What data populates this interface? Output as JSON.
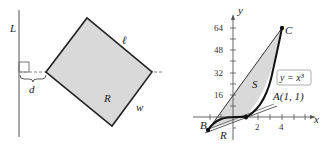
{
  "figure_left": {
    "labels": {
      "line": "L",
      "length": "ℓ",
      "width": "w",
      "region": "R",
      "distance": "d"
    },
    "colors": {
      "fill": "#d9d9d9",
      "stroke": "#222222",
      "dash": "#888888"
    }
  },
  "figure_right": {
    "axes": {
      "x_label": "x",
      "y_label": "y"
    },
    "y_ticks": [
      "16",
      "32",
      "48",
      "64"
    ],
    "x_ticks": [
      "2",
      "4"
    ],
    "curve_label": "y = x³",
    "points": {
      "A": "A(1, 1)",
      "B": "B",
      "C": "C"
    },
    "regions": {
      "S": "S",
      "R": "R"
    },
    "colors": {
      "fill": "#d9d9d9",
      "curve": "#111111",
      "box_border": "#999999"
    }
  }
}
